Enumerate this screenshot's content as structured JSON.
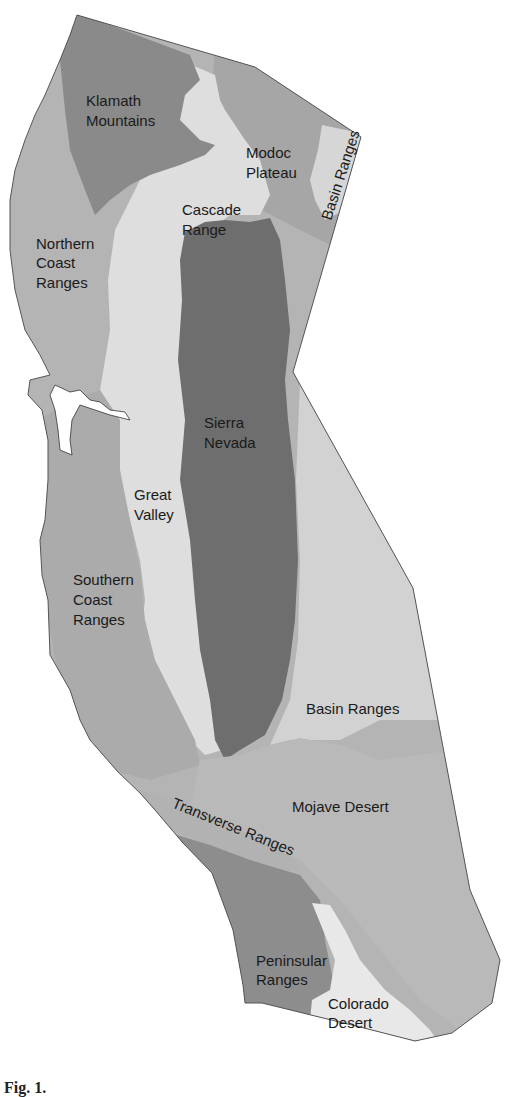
{
  "map": {
    "title": "Geomorphic provinces of California",
    "colors": {
      "outline": "#555555",
      "klamath_mountains": "#8a8a8a",
      "northern_coast_ranges": "#b4b4b4",
      "cascade_range": "#dcdcdc",
      "modoc_plateau": "#a6a6a6",
      "basin_ranges_north": "#d6d6d6",
      "great_valley": "#dedede",
      "sierra_nevada": "#6e6e6e",
      "southern_coast_ranges": "#ababab",
      "basin_ranges_south": "#d2d2d2",
      "mojave_desert": "#b9b9b9",
      "transverse_ranges": "#b2b2b2",
      "peninsular_ranges": "#8d8d8d",
      "colorado_desert": "#e8e8e8",
      "water": "#ffffff"
    },
    "labels": {
      "klamath_1": "Klamath",
      "klamath_2": "Mountains",
      "modoc_1": "Modoc",
      "modoc_2": "Plateau",
      "basin_north": "Basin Ranges",
      "cascade_1": "Cascade",
      "cascade_2": "Range",
      "ncoast_1": "Northern",
      "ncoast_2": "Coast",
      "ncoast_3": "Ranges",
      "sierra_1": "Sierra",
      "sierra_2": "Nevada",
      "valley_1": "Great",
      "valley_2": "Valley",
      "scoast_1": "Southern",
      "scoast_2": "Coast",
      "scoast_3": "Ranges",
      "basin_south": "Basin Ranges",
      "mojave": "Mojave Desert",
      "transverse": "Transverse Ranges",
      "peninsular_1": "Peninsular",
      "peninsular_2": "Ranges",
      "colorado_1": "Colorado",
      "colorado_2": "Desert"
    }
  },
  "caption": {
    "prefix": "Fig. 1.",
    "text": ""
  }
}
